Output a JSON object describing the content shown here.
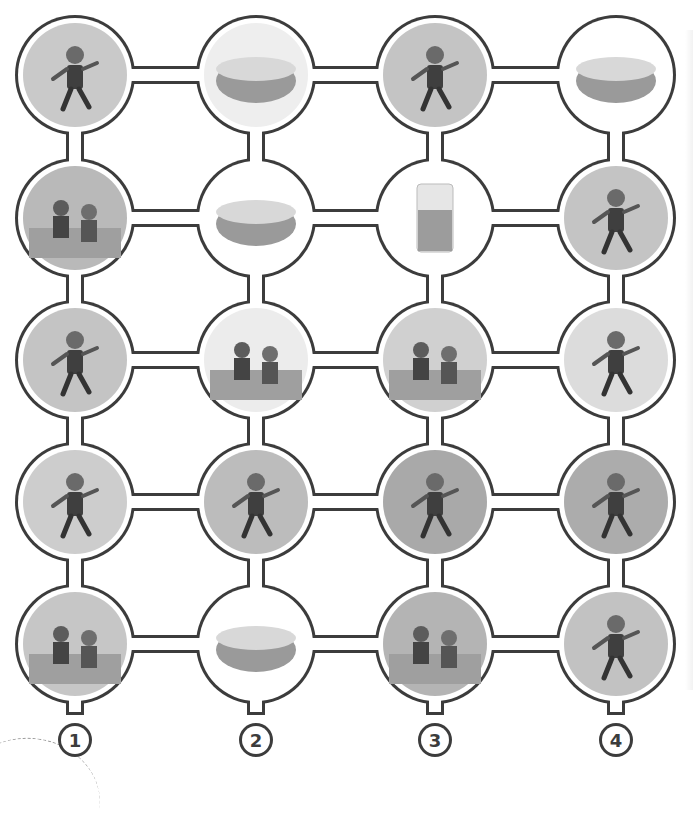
{
  "puzzle": {
    "title": "",
    "grid": {
      "columns": 4,
      "rows": 5
    },
    "outline_color": "#3c3c3c",
    "fill_color": "#ffffff",
    "column_centers_x": [
      75,
      256,
      435,
      616
    ],
    "row_centers_y": [
      75,
      218,
      360,
      502,
      644
    ],
    "column_labels": [
      "1",
      "2",
      "3",
      "4"
    ],
    "cells": [
      [
        {
          "id": "r1c1",
          "subject": "boy jumping",
          "bg": "#c9c9c9",
          "kind": "person"
        },
        {
          "id": "r1c2",
          "subject": "roast chicken",
          "bg": "#eeeeee",
          "kind": "food"
        },
        {
          "id": "r1c3",
          "subject": "girl kicking football",
          "bg": "#c4c4c4",
          "kind": "person"
        },
        {
          "id": "r1c4",
          "subject": "bowl of rice",
          "bg": "#ffffff",
          "kind": "food"
        }
      ],
      [
        {
          "id": "r2c1",
          "subject": "baseball stadium",
          "bg": "#b9b9b9",
          "kind": "scene"
        },
        {
          "id": "r2c2",
          "subject": "bowl of soup",
          "bg": "#ffffff",
          "kind": "food"
        },
        {
          "id": "r2c3",
          "subject": "glass of juice",
          "bg": "#ffffff",
          "kind": "drink"
        },
        {
          "id": "r2c4",
          "subject": "boy playing basketball",
          "bg": "#c4c4c4",
          "kind": "person"
        }
      ],
      [
        {
          "id": "r3c1",
          "subject": "girl playing volleyball",
          "bg": "#c4c4c4",
          "kind": "person"
        },
        {
          "id": "r3c2",
          "subject": "waiter serving girl",
          "bg": "#ececec",
          "kind": "scene"
        },
        {
          "id": "r3c3",
          "subject": "boy and woman with clock",
          "bg": "#d0d0d0",
          "kind": "scene"
        },
        {
          "id": "r3c4",
          "subject": "girl reaching shelf",
          "bg": "#dcdcdc",
          "kind": "person"
        }
      ],
      [
        {
          "id": "r4c1",
          "subject": "boy with ice cream",
          "bg": "#cdcdcd",
          "kind": "person"
        },
        {
          "id": "r4c2",
          "subject": "girl playing table tennis",
          "bg": "#bcbcbc",
          "kind": "person"
        },
        {
          "id": "r4c3",
          "subject": "boy juggling",
          "bg": "#a9a9a9",
          "kind": "person"
        },
        {
          "id": "r4c4",
          "subject": "girl juggling",
          "bg": "#acacac",
          "kind": "person"
        }
      ],
      [
        {
          "id": "r5c1",
          "subject": "football team",
          "bg": "#c6c6c6",
          "kind": "scene"
        },
        {
          "id": "r5c2",
          "subject": "loaf of bread",
          "bg": "#ffffff",
          "kind": "food"
        },
        {
          "id": "r5c3",
          "subject": "tennis racket hitting ball",
          "bg": "#b4b4b4",
          "kind": "scene"
        },
        {
          "id": "r5c4",
          "subject": "girl running",
          "bg": "#c2c2c2",
          "kind": "person"
        }
      ]
    ]
  }
}
